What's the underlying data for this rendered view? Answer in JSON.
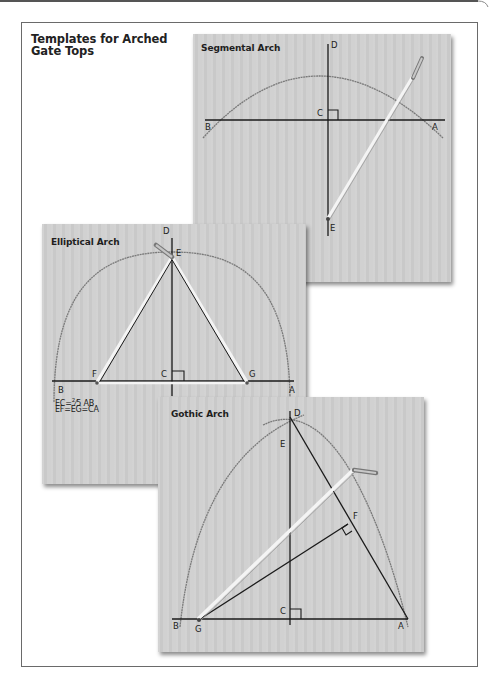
{
  "page": {
    "heading": "Templates for Arched\nGate Tops"
  },
  "boards": {
    "segmental": {
      "title": "Segmental Arch",
      "points": {
        "D": "D",
        "C": "C",
        "B": "B",
        "A": "A",
        "E": "E"
      }
    },
    "elliptical": {
      "title": "Elliptical Arch",
      "points": {
        "D": "D",
        "E": "E",
        "F": "F",
        "C": "C",
        "G": "G",
        "B": "B",
        "A": "A"
      },
      "formula_line1_prefix": "EC=",
      "formula_line1_num": "2",
      "formula_line1_sep": "⁄",
      "formula_line1_den": "5",
      "formula_line1_suffix": " AB",
      "formula_line2": "EF=EG=CA"
    },
    "gothic": {
      "title": "Gothic Arch",
      "points": {
        "D": "D",
        "E": "E",
        "F": "F",
        "C": "C",
        "B": "B",
        "G": "G",
        "A": "A"
      }
    }
  },
  "colors": {
    "board": "#cfcfcf",
    "line": "#1a1a1a",
    "arc": "#7a7a7a",
    "string": "#f2f2f2",
    "frame": "#6a6a6a"
  }
}
